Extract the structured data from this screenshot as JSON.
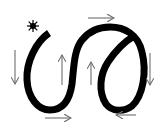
{
  "diagram": {
    "title": "Path traversal direction diagram",
    "colors": {
      "background": "#ffffff",
      "path": "#000000",
      "arrow": "#6e6e6e",
      "start_marker": "#000000"
    },
    "start_marker": {
      "icon": "star-burst-icon",
      "x": 33,
      "y": 26
    },
    "path": {
      "description": "Thick black curve: left arc down, S through center, loop on right crossing itself",
      "stroke_width": 7
    },
    "arrows": [
      {
        "name": "arrow-left-down",
        "direction": "down",
        "x1": 15,
        "y1": 50,
        "x2": 15,
        "y2": 84
      },
      {
        "name": "arrow-center-left-up",
        "direction": "up",
        "x1": 62,
        "y1": 85,
        "x2": 62,
        "y2": 55
      },
      {
        "name": "arrow-center-right-up",
        "direction": "up",
        "x1": 91,
        "y1": 85,
        "x2": 91,
        "y2": 62
      },
      {
        "name": "arrow-top-right",
        "direction": "right",
        "x1": 88,
        "y1": 18,
        "x2": 114,
        "y2": 18
      },
      {
        "name": "arrow-bottom-right",
        "direction": "right",
        "x1": 45,
        "y1": 118,
        "x2": 71,
        "y2": 118
      },
      {
        "name": "arrow-right-down",
        "direction": "down",
        "x1": 150,
        "y1": 53,
        "x2": 150,
        "y2": 85
      },
      {
        "name": "arrow-bottom-left",
        "direction": "left",
        "x1": 136,
        "y1": 115,
        "x2": 116,
        "y2": 115
      }
    ]
  }
}
